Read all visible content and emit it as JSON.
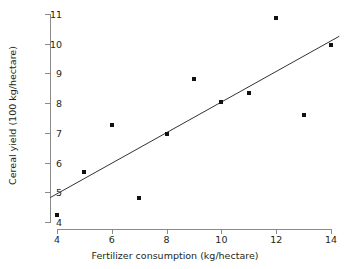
{
  "chart_data": {
    "type": "scatter",
    "title": "",
    "xlabel": "Fertilizer consumption (kg/hectare)",
    "ylabel": "Cereal yield (100 kg/hectare)",
    "xlim": [
      4,
      14
    ],
    "ylim": [
      4,
      11
    ],
    "xticks": [
      4,
      6,
      8,
      10,
      12,
      14
    ],
    "yticks": [
      4,
      5,
      6,
      7,
      8,
      9,
      10,
      11
    ],
    "grid": false,
    "legend": "none",
    "x": [
      4,
      5,
      6,
      7,
      8,
      9,
      10,
      11,
      12,
      13,
      14
    ],
    "y": [
      4.25,
      5.68,
      7.25,
      4.82,
      6.97,
      8.82,
      8.05,
      8.33,
      10.85,
      7.6,
      9.95
    ],
    "points": [
      {
        "x": 4,
        "y": 4.25
      },
      {
        "x": 5,
        "y": 5.68
      },
      {
        "x": 6,
        "y": 7.25
      },
      {
        "x": 7,
        "y": 4.82
      },
      {
        "x": 8,
        "y": 6.97
      },
      {
        "x": 9,
        "y": 8.82
      },
      {
        "x": 10,
        "y": 8.05
      },
      {
        "x": 11,
        "y": 8.33
      },
      {
        "x": 12,
        "y": 10.85
      },
      {
        "x": 13,
        "y": 7.6
      },
      {
        "x": 14,
        "y": 9.95
      }
    ],
    "series": [
      {
        "name": "observations",
        "type": "scatter",
        "marker": "square",
        "color": "#111111",
        "values": [
          4.25,
          5.68,
          7.25,
          4.82,
          6.97,
          8.82,
          8.05,
          8.33,
          10.85,
          7.6,
          9.95
        ]
      },
      {
        "name": "trend-line",
        "type": "line",
        "color": "#333333",
        "endpoints": [
          {
            "x": 3.75,
            "y": 4.82
          },
          {
            "x": 14.3,
            "y": 10.25
          }
        ]
      }
    ],
    "marker_color": "#111111",
    "line_color": "#333333",
    "axis_color": "#8a8a8a",
    "text_color": "#231f20",
    "background": "#ffffff"
  },
  "axes": {
    "x": {
      "title": "Fertilizer consumption (kg/hectare)",
      "ticks": [
        "4",
        "6",
        "8",
        "10",
        "12",
        "14"
      ]
    },
    "y": {
      "title": "Cereal yield (100 kg/hectare)",
      "ticks": [
        "11",
        "10",
        "9",
        "8",
        "7",
        "6",
        "5",
        "4"
      ]
    }
  }
}
